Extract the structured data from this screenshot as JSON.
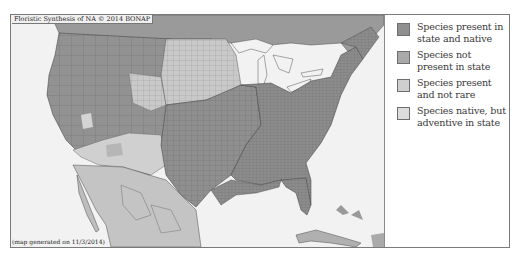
{
  "map": {
    "copyright": "Floristic Synthesis of NA © 2014 BONAP",
    "generated": "(map generated on 11/3/2014)",
    "colors": {
      "present_native": "#8f8f8f",
      "not_present": "#a9a9a9",
      "present_not_rare": "#cfcfcf",
      "native_adventive": "#dedede",
      "water": "#f2f2f2",
      "border": "#3d3d3d"
    }
  },
  "legend": {
    "items": [
      {
        "label": "Species present in state and native",
        "color": "#8f8f8f"
      },
      {
        "label": "Species not present in state",
        "color": "#a9a9a9"
      },
      {
        "label": "Species present and not rare",
        "color": "#cfcfcf"
      },
      {
        "label": "Species native, but adventive in state",
        "color": "#dcdcdc"
      }
    ]
  }
}
